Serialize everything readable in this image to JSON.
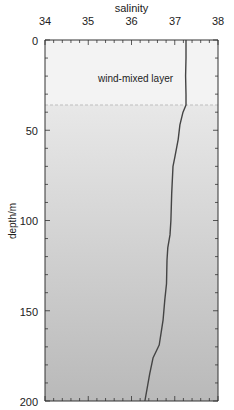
{
  "chart_data": {
    "type": "line",
    "title": "salinity",
    "xlabel": "salinity",
    "ylabel": "depth/m",
    "xlim": [
      34,
      38
    ],
    "ylim": [
      0,
      200
    ],
    "y_inverted": true,
    "x_axis_position": "top",
    "xticks": [
      34,
      35,
      36,
      37,
      38
    ],
    "yticks": [
      0,
      50,
      100,
      150,
      200
    ],
    "grid": false,
    "series": [
      {
        "name": "salinity profile",
        "depth": [
          0,
          10,
          20,
          30,
          36,
          40,
          47,
          55,
          65,
          70,
          85,
          100,
          108,
          115,
          122,
          135,
          144,
          155,
          163,
          169,
          176,
          185,
          200
        ],
        "salinity": [
          37.26,
          37.26,
          37.25,
          37.26,
          37.26,
          37.19,
          37.12,
          37.08,
          37.0,
          36.96,
          36.93,
          36.91,
          36.89,
          36.84,
          36.82,
          36.81,
          36.77,
          36.73,
          36.68,
          36.64,
          36.5,
          36.42,
          36.31
        ]
      }
    ],
    "annotations": [
      {
        "text": "wind-mixed layer",
        "depth_range": [
          0,
          36
        ],
        "boundary_depth": 36,
        "boundary_style": "dashed"
      }
    ]
  },
  "labels": {
    "title": "salinity",
    "ylabel": "depth/m",
    "annotation": "wind-mixed layer",
    "xticks": [
      "34",
      "35",
      "36",
      "37",
      "38"
    ],
    "yticks": [
      "0",
      "50",
      "100",
      "150",
      "200"
    ]
  },
  "colors": {
    "mixed_layer_bg": "#f2f2f2",
    "gradient_top": "#e8e8e8",
    "gradient_bottom": "#b9b9b9",
    "line": "#444444",
    "dashed_line": "#bdbdbd",
    "axis": "#333333"
  }
}
